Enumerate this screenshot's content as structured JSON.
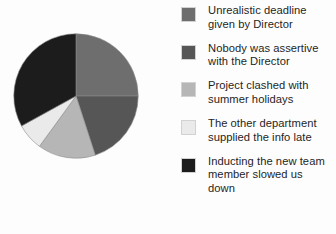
{
  "chart_data": {
    "type": "pie",
    "title": "",
    "legend_position": "right",
    "categories": [
      "Unrealistic deadline given by Director",
      "Nobody was assertive with the Director",
      "Project clashed with summer holidays",
      "The other department supplied the info late",
      "Inducting the new team member slowed us down"
    ],
    "values": [
      25,
      20,
      15,
      7,
      33
    ],
    "colors": [
      "#6e6e6e",
      "#565656",
      "#b6b6b6",
      "#eaeaea",
      "#1c1c1c"
    ],
    "start_angle_deg": 0,
    "direction": "clockwise",
    "slices": [
      {
        "label": "Unrealistic deadline given by Director",
        "value": 25,
        "color": "#6e6e6e",
        "start_deg": 0,
        "end_deg": 90
      },
      {
        "label": "Nobody was assertive with the Director",
        "value": 20,
        "color": "#565656",
        "start_deg": 90,
        "end_deg": 162
      },
      {
        "label": "Project clashed with summer holidays",
        "value": 15,
        "color": "#b6b6b6",
        "start_deg": 162,
        "end_deg": 216
      },
      {
        "label": "The other department supplied the info late",
        "value": 7,
        "color": "#eaeaea",
        "start_deg": 216,
        "end_deg": 241.2
      },
      {
        "label": "Inducting the new team member slowed us down",
        "value": 33,
        "color": "#1c1c1c",
        "start_deg": 241.2,
        "end_deg": 360
      }
    ]
  },
  "legend": {
    "items": [
      {
        "label": "Unrealistic deadline\ngiven by Director",
        "color": "#6e6e6e"
      },
      {
        "label": "Nobody was assertive\nwith the Director",
        "color": "#565656"
      },
      {
        "label": "Project clashed with\nsummer holidays",
        "color": "#b6b6b6"
      },
      {
        "label": "The other department\nsupplied the info late",
        "color": "#eaeaea"
      },
      {
        "label": "Inducting the new team\nmember slowed us\ndown",
        "color": "#1c1c1c"
      }
    ]
  }
}
